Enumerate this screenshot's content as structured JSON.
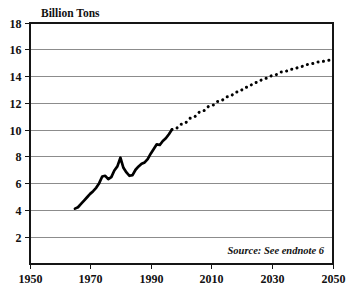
{
  "chart_data": {
    "type": "line",
    "title": "Billion Tons",
    "xlabel": "",
    "ylabel": "Billion Tons",
    "xlim": [
      1950,
      2050
    ],
    "ylim": [
      0,
      18
    ],
    "grid": true,
    "legend": "none",
    "x_ticks": [
      "1950",
      "1970",
      "1990",
      "2010",
      "2030",
      "2050"
    ],
    "x_tick_values": [
      1950,
      1970,
      1990,
      2010,
      2030,
      2050
    ],
    "y_ticks": [
      "2",
      "4",
      "6",
      "8",
      "10",
      "12",
      "14",
      "16",
      "18"
    ],
    "y_tick_values": [
      2,
      4,
      6,
      8,
      10,
      12,
      14,
      16,
      18
    ],
    "annotation": "Source: See endnote 6",
    "series": [
      {
        "name": "historic",
        "style": "solid",
        "color": "#000000",
        "x": [
          1965,
          1966,
          1967,
          1968,
          1969,
          1970,
          1971,
          1972,
          1973,
          1974,
          1975,
          1976,
          1977,
          1978,
          1979,
          1980,
          1981,
          1982,
          1983,
          1984,
          1985,
          1986,
          1987,
          1988,
          1989,
          1990,
          1991,
          1992,
          1993,
          1994,
          1995,
          1996,
          1997
        ],
        "y": [
          4.1,
          4.2,
          4.45,
          4.7,
          4.95,
          5.2,
          5.4,
          5.65,
          6.0,
          6.5,
          6.55,
          6.3,
          6.45,
          6.95,
          7.25,
          7.9,
          7.15,
          6.8,
          6.55,
          6.6,
          7.0,
          7.25,
          7.45,
          7.55,
          7.8,
          8.2,
          8.55,
          8.9,
          8.85,
          9.15,
          9.35,
          9.65,
          10.0
        ]
      },
      {
        "name": "projected",
        "style": "dotted",
        "color": "#000000",
        "x": [
          1997,
          2000,
          2003,
          2006,
          2009,
          2012,
          2015,
          2018,
          2021,
          2024,
          2027,
          2030,
          2033,
          2036,
          2039,
          2042,
          2045,
          2048,
          2050
        ],
        "y": [
          10.0,
          10.4,
          10.85,
          11.3,
          11.72,
          12.1,
          12.45,
          12.8,
          13.15,
          13.5,
          13.8,
          14.05,
          14.3,
          14.5,
          14.7,
          14.9,
          15.05,
          15.17,
          15.25
        ]
      }
    ]
  },
  "colors": {
    "background": "#ffffff",
    "frame": "#151515",
    "gridline": "#8c8c8c",
    "series": "#000000"
  }
}
